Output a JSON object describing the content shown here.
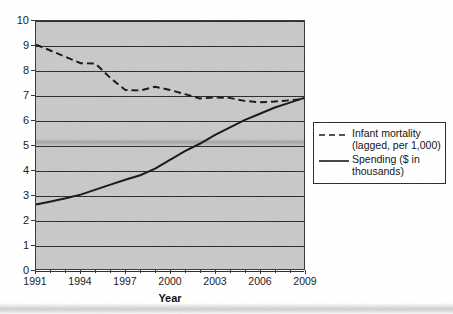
{
  "chart_data": {
    "type": "line",
    "title": "",
    "xlabel": "Year",
    "ylabel": "",
    "xlim": [
      1991,
      2009
    ],
    "ylim": [
      0,
      10
    ],
    "grid": true,
    "legend_position": "right",
    "y_ticks": [
      "10",
      "9",
      "8",
      "7",
      "6",
      "5",
      "4",
      "3",
      "2",
      "1",
      "0"
    ],
    "x_ticks": [
      "1991",
      "1994",
      "1997",
      "2000",
      "2003",
      "2006",
      "2009"
    ],
    "x_all_years": [
      1991,
      1992,
      1993,
      1994,
      1995,
      1996,
      1997,
      1998,
      1999,
      2000,
      2001,
      2002,
      2003,
      2004,
      2005,
      2006,
      2007,
      2008,
      2009
    ],
    "series": [
      {
        "name": "Infant mortality (lagged, per 1,000)",
        "style": "dashed",
        "color": "#1a1a1a",
        "values": [
          9.05,
          8.8,
          8.55,
          8.3,
          8.28,
          7.7,
          7.22,
          7.2,
          7.35,
          7.22,
          7.05,
          6.88,
          6.92,
          6.9,
          6.78,
          6.72,
          6.75,
          6.8,
          6.85
        ]
      },
      {
        "name": "Spending ($ in thousands)",
        "style": "solid",
        "color": "#1a1a1a",
        "values": [
          2.6,
          2.72,
          2.85,
          3.0,
          3.2,
          3.4,
          3.6,
          3.78,
          4.05,
          4.4,
          4.75,
          5.05,
          5.4,
          5.7,
          6.0,
          6.25,
          6.5,
          6.7,
          6.9
        ]
      }
    ]
  },
  "legend": {
    "items": [
      {
        "label": "Infant mortality\n(lagged, per 1,000)",
        "style": "dashed"
      },
      {
        "label": "Spending ($ in\nthousands)",
        "style": "solid"
      }
    ]
  }
}
